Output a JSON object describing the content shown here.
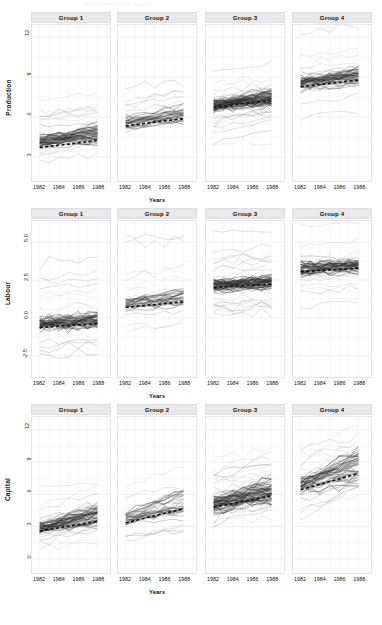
{
  "figure": {
    "ghost_header_text": "Production   Labour   Capital",
    "background": "#ffffff",
    "strip_fill": "#e9e9ec",
    "trend_color": "#121212",
    "grid_color": "#f2f2f4"
  },
  "axis": {
    "xlabel": "Years",
    "xticks": [
      "1982",
      "1984",
      "1986",
      "1988"
    ],
    "xtick_values": [
      1982,
      1984,
      1986,
      1988
    ],
    "xlim": [
      1981.2,
      1989.3
    ]
  },
  "rows": [
    {
      "ylabel": "Production",
      "yticks": [
        "12",
        "9",
        "6",
        "3"
      ],
      "ytick_values": [
        12,
        9,
        6,
        3
      ],
      "ylim": [
        1.2,
        12.9
      ]
    },
    {
      "ylabel": "Labour",
      "yticks": [
        "5.0",
        "2.5",
        "0.0",
        "-2.5"
      ],
      "ytick_values": [
        5.0,
        2.5,
        0.0,
        -2.5
      ],
      "ylim": [
        -3.9,
        6.4
      ]
    },
    {
      "ylabel": "Capital",
      "yticks": [
        "12",
        "9",
        "6",
        "3",
        "0"
      ],
      "ytick_values": [
        12,
        9,
        6,
        3,
        0
      ],
      "ylim": [
        -1.3,
        13.2
      ]
    }
  ],
  "panels": [
    {
      "label": "Group 1"
    },
    {
      "label": "Group 2"
    },
    {
      "label": "Group 3"
    },
    {
      "label": "Group 4"
    }
  ],
  "chart_data": {
    "type": "line",
    "title": "",
    "subtitle": "",
    "xlabel": "Years",
    "ylabel": "Production / Labour / Capital",
    "layout": "3 rows (response variable) x 4 columns (group), trellis / spaghetti plot",
    "grid": true,
    "legend": "none",
    "x": [
      1982,
      1983,
      1984,
      1985,
      1986,
      1987,
      1988
    ],
    "row_panels": [
      "Production",
      "Labour",
      "Capital"
    ],
    "col_panels": [
      "Group 1",
      "Group 2",
      "Group 3",
      "Group 4"
    ],
    "annotation": "Each thin grey line is one firm's trajectory; the bold black dashed line is the group mean trend.",
    "cells": [
      {
        "row": "Production",
        "col": "Group 1",
        "ylim": [
          1.2,
          12.9
        ],
        "n_series": 62,
        "spaghetti_band": [
          2.6,
          6.6
        ],
        "spaghetti_center": [
          3.9,
          4.5
        ],
        "series": [
          {
            "name": "mean trend",
            "style": "dashed",
            "values": [
              3.72,
              3.8,
              3.88,
              3.97,
              4.06,
              4.15,
              4.24
            ]
          }
        ]
      },
      {
        "row": "Production",
        "col": "Group 2",
        "ylim": [
          1.2,
          12.9
        ],
        "n_series": 34,
        "spaghetti_band": [
          3.6,
          7.2
        ],
        "spaghetti_center": [
          5.3,
          5.9
        ],
        "series": [
          {
            "name": "mean trend",
            "style": "dashed",
            "values": [
              5.32,
              5.42,
              5.52,
              5.61,
              5.7,
              5.79,
              5.88
            ]
          }
        ]
      },
      {
        "row": "Production",
        "col": "Group 3",
        "ylim": [
          1.2,
          12.9
        ],
        "n_series": 78,
        "spaghetti_band": [
          4.6,
          9.3
        ],
        "spaghetti_center": [
          6.6,
          7.2
        ],
        "series": [
          {
            "name": "mean trend",
            "style": "dashed",
            "values": [
              6.7,
              6.8,
              6.9,
              7.0,
              7.08,
              7.16,
              7.24
            ]
          }
        ]
      },
      {
        "row": "Production",
        "col": "Group 4",
        "ylim": [
          1.2,
          12.9
        ],
        "n_series": 54,
        "spaghetti_band": [
          6.4,
          10.6
        ],
        "spaghetti_center": [
          8.2,
          8.8
        ],
        "series": [
          {
            "name": "mean trend",
            "style": "dashed",
            "values": [
              8.28,
              8.36,
              8.44,
              8.52,
              8.6,
              8.68,
              8.76
            ]
          }
        ]
      },
      {
        "row": "Labour",
        "col": "Group 1",
        "ylim": [
          -3.9,
          6.4
        ],
        "n_series": 62,
        "spaghetti_band": [
          -2.9,
          2.2
        ],
        "spaghetti_center": [
          -0.7,
          -0.2
        ],
        "series": [
          {
            "name": "mean trend",
            "style": "dashed",
            "values": [
              -0.62,
              -0.58,
              -0.54,
              -0.5,
              -0.46,
              -0.42,
              -0.38
            ]
          }
        ]
      },
      {
        "row": "Labour",
        "col": "Group 2",
        "ylim": [
          -3.9,
          6.4
        ],
        "n_series": 34,
        "spaghetti_band": [
          -1.0,
          3.1
        ],
        "spaghetti_center": [
          0.6,
          1.1
        ],
        "series": [
          {
            "name": "mean trend",
            "style": "dashed",
            "values": [
              0.7,
              0.76,
              0.82,
              0.88,
              0.94,
              1.0,
              1.06
            ]
          }
        ]
      },
      {
        "row": "Labour",
        "col": "Group 3",
        "ylim": [
          -3.9,
          6.4
        ],
        "n_series": 78,
        "spaghetti_band": [
          0.2,
          4.0
        ],
        "spaghetti_center": [
          1.8,
          2.4
        ],
        "series": [
          {
            "name": "mean trend",
            "style": "dashed",
            "values": [
              2.02,
              2.06,
              2.1,
              2.13,
              2.16,
              2.19,
              2.22
            ]
          }
        ]
      },
      {
        "row": "Labour",
        "col": "Group 4",
        "ylim": [
          -3.9,
          6.4
        ],
        "n_series": 54,
        "spaghetti_band": [
          1.2,
          5.1
        ],
        "spaghetti_center": [
          2.9,
          3.5
        ],
        "series": [
          {
            "name": "mean trend",
            "style": "dashed",
            "values": [
              3.05,
              3.09,
              3.13,
              3.17,
              3.21,
              3.25,
              3.29
            ]
          }
        ]
      },
      {
        "row": "Capital",
        "col": "Group 1",
        "ylim": [
          -1.3,
          13.2
        ],
        "n_series": 62,
        "spaghetti_band": [
          0.4,
          5.4
        ],
        "spaghetti_center": [
          2.6,
          3.4
        ],
        "series": [
          {
            "name": "mean trend",
            "style": "dashed",
            "values": [
              2.6,
              2.75,
              2.9,
              3.05,
              3.2,
              3.35,
              3.5
            ]
          }
        ]
      },
      {
        "row": "Capital",
        "col": "Group 2",
        "ylim": [
          -1.3,
          13.2
        ],
        "n_series": 34,
        "spaghetti_band": [
          1.6,
          7.0
        ],
        "spaghetti_center": [
          3.4,
          4.4
        ],
        "series": [
          {
            "name": "mean trend",
            "style": "dashed",
            "values": [
              3.35,
              3.58,
              3.8,
              4.02,
              4.24,
              4.46,
              4.68
            ]
          }
        ]
      },
      {
        "row": "Capital",
        "col": "Group 3",
        "ylim": [
          -1.3,
          13.2
        ],
        "n_series": 78,
        "spaghetti_band": [
          2.6,
          8.4
        ],
        "spaghetti_center": [
          4.6,
          5.6
        ],
        "series": [
          {
            "name": "mean trend",
            "style": "dashed",
            "values": [
              4.8,
              4.98,
              5.16,
              5.34,
              5.52,
              5.7,
              5.88
            ]
          }
        ]
      },
      {
        "row": "Capital",
        "col": "Group 4",
        "ylim": [
          -1.3,
          13.2
        ],
        "n_series": 54,
        "spaghetti_band": [
          4.2,
          10.2
        ],
        "spaghetti_center": [
          6.3,
          7.4
        ],
        "series": [
          {
            "name": "mean trend",
            "style": "dashed",
            "values": [
              6.45,
              6.7,
              6.95,
              7.2,
              7.45,
              7.7,
              7.95
            ]
          }
        ]
      }
    ]
  }
}
